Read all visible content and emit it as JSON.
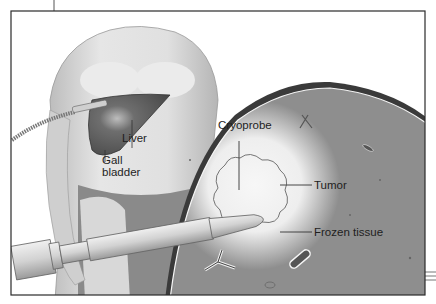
{
  "figure": {
    "labels": {
      "liver": "Liver",
      "gall_bladder_line1": "Gall",
      "gall_bladder_line2": "bladder",
      "cryoprobe": "Cryoprobe",
      "tumor": "Tumor",
      "frozen_tissue": "Frozen tissue"
    },
    "colors": {
      "frame": "#2a2a2a",
      "liver_tissue": "#8c8c8c",
      "frozen_halo": "#f2f2f2",
      "skin": "#d6d6d6",
      "liver_organ": "#5a5a5a",
      "probe": "#d9d9d9"
    }
  }
}
